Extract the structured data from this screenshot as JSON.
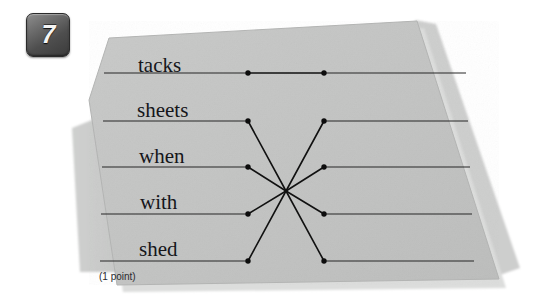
{
  "question": {
    "number": "7",
    "points_label": "(1 point)"
  },
  "colors": {
    "page_background": "#ffffff",
    "card_face": "#c3c4c3",
    "card_back_sheet": "#cfd0cf",
    "card_shadow": "#d8d9d8",
    "rule_line": "#262626",
    "connector_line": "#111111",
    "dot": "#0d0d0d",
    "badge_dark": "#3b3b3b",
    "badge_light": "#8e8e8e",
    "text": "#15161a"
  },
  "matching_exercise": {
    "left_items": [
      {
        "id": "tacks",
        "label": "tacks",
        "word_x": 138,
        "word_y": 55,
        "line_y": 73,
        "line_x1": 104,
        "line_x2": 248,
        "dot_x": 248,
        "dot_y": 73
      },
      {
        "id": "sheets",
        "label": "sheets",
        "word_x": 137,
        "word_y": 100,
        "line_y": 121,
        "line_x1": 103,
        "line_x2": 248,
        "dot_x": 248,
        "dot_y": 121
      },
      {
        "id": "when",
        "label": "when",
        "word_x": 139,
        "word_y": 146,
        "line_y": 167,
        "line_x1": 102,
        "line_x2": 248,
        "dot_x": 248,
        "dot_y": 167
      },
      {
        "id": "with",
        "label": "with",
        "word_x": 140,
        "word_y": 192,
        "line_y": 214,
        "line_x1": 101,
        "line_x2": 248,
        "dot_x": 248,
        "dot_y": 214
      },
      {
        "id": "shed",
        "label": "shed",
        "word_x": 139,
        "word_y": 239,
        "line_y": 261,
        "line_x1": 100,
        "line_x2": 248,
        "dot_x": 248,
        "dot_y": 261
      }
    ],
    "right_items": [
      {
        "id": "right-1",
        "line_y": 73,
        "line_x1": 324,
        "line_x2": 466,
        "dot_x": 324,
        "dot_y": 73
      },
      {
        "id": "right-2",
        "line_y": 121,
        "line_x1": 324,
        "line_x2": 468,
        "dot_x": 324,
        "dot_y": 121
      },
      {
        "id": "right-3",
        "line_y": 167,
        "line_x1": 324,
        "line_x2": 470,
        "dot_x": 324,
        "dot_y": 167
      },
      {
        "id": "right-4",
        "line_y": 214,
        "line_x1": 324,
        "line_x2": 472,
        "dot_x": 324,
        "dot_y": 214
      },
      {
        "id": "right-5",
        "line_y": 261,
        "line_x1": 324,
        "line_x2": 474,
        "dot_x": 324,
        "dot_y": 261
      }
    ],
    "hub": {
      "x": 286,
      "y": 191
    },
    "connections": [
      {
        "from": "tacks",
        "to": "right-1",
        "via_hub": false
      },
      {
        "from": "sheets",
        "to": "right-3",
        "via_hub": true
      },
      {
        "from": "when",
        "to": "right-2",
        "via_hub": true
      },
      {
        "from": "with",
        "to": "right-4",
        "via_hub": true
      },
      {
        "from": "shed",
        "to": "right-5",
        "via_hub": true
      }
    ]
  },
  "card_geometry": {
    "front_points": "89,98 107,38 418,22 498,279 117,284",
    "back_points": "74,126 110,110 120,268 82,268",
    "shadow_points": "110,42 430,26 513,268 500,280 418,24"
  }
}
